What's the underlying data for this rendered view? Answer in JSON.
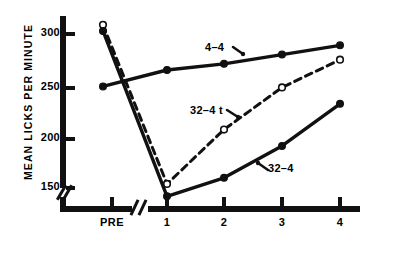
{
  "axes": {
    "ylabel": "MEAN LICKS PER MINUTE",
    "yticks": [
      "150",
      "200",
      "250",
      "300"
    ],
    "xticks": [
      "PRE",
      "1",
      "2",
      "3",
      "4"
    ]
  },
  "annotations": {
    "upper": "4–4",
    "middle": "32–4 t",
    "lower": "32–4"
  },
  "colors": {
    "ink": "#111111",
    "background": "#ffffff"
  },
  "chart_data": {
    "type": "line",
    "title": "",
    "xlabel": "",
    "ylabel": "MEAN LICKS PER MINUTE",
    "categories": [
      "PRE",
      "1",
      "2",
      "3",
      "4"
    ],
    "ylim": [
      130,
      315
    ],
    "yticks": [
      150,
      200,
      250,
      300
    ],
    "grid": false,
    "legend": "inline-annotations",
    "axis_breaks": {
      "y_below": 150,
      "x_between": [
        "PRE",
        "1"
      ]
    },
    "series": [
      {
        "name": "4–4",
        "marker": "filled-circle",
        "line": "solid",
        "values": [
          247,
          263,
          269,
          278,
          287
        ]
      },
      {
        "name": "32–4 t",
        "marker": "open-circle",
        "line": "dashed",
        "values": [
          307,
          152,
          205,
          246,
          273
        ]
      },
      {
        "name": "32–4",
        "marker": "filled-circle",
        "line": "solid",
        "values": [
          301,
          140,
          158,
          189,
          230
        ]
      }
    ]
  }
}
